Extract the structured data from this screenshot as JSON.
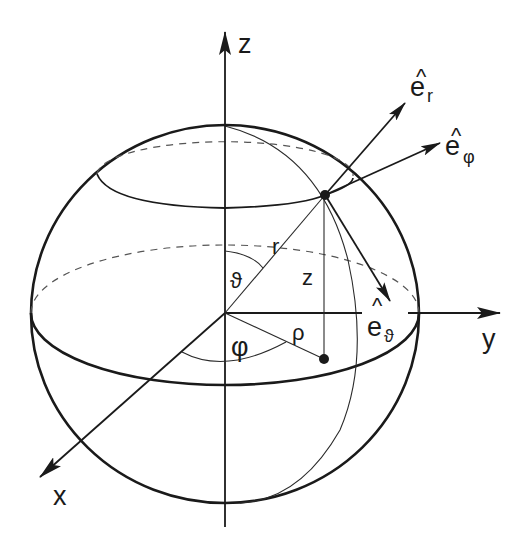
{
  "diagram": {
    "axes": {
      "z": "z",
      "y": "y",
      "x": "x"
    },
    "labels": {
      "radius": "r",
      "height": "z",
      "cyl_radius": "ρ",
      "polar_angle": "ϑ",
      "azimuth_angle": "φ"
    },
    "unit_vectors": [
      {
        "base": "e",
        "hat": "^",
        "sub": "r",
        "name": "radial"
      },
      {
        "base": "e",
        "hat": "^",
        "sub": "φ",
        "name": "azimuthal"
      },
      {
        "base": "e",
        "hat": "^",
        "sub": "ϑ",
        "name": "polar"
      }
    ],
    "colors": {
      "ink": "#1a1a1a",
      "dashed": "#555555",
      "background": "#ffffff"
    }
  }
}
